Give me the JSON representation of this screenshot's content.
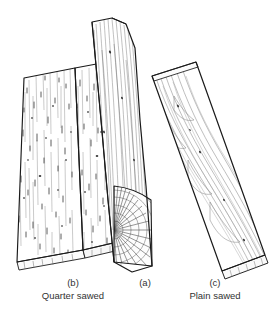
{
  "figure": {
    "background_color": "#ffffff",
    "ink_color": "#1a1a1a",
    "grain_color": "#8a8a8a",
    "width": 273,
    "height": 324
  },
  "captions": {
    "b": {
      "letter": "(b)",
      "name": "Quarter sawed"
    },
    "a": {
      "letter": "(a)",
      "name": ""
    },
    "c": {
      "letter": "(c)",
      "name": "Plain sawed"
    }
  },
  "parts": [
    {
      "id": "b",
      "label": "Quarter sawed",
      "letter": "(b)",
      "description": "Two flat boards lying side by side, leaning left, showing fine straight vertical ray fleck grain"
    },
    {
      "id": "a",
      "label": "",
      "letter": "(a)",
      "description": "Log quarter wedge standing upright, quarter-circle end showing radial rays and concentric growth rings"
    },
    {
      "id": "c",
      "label": "Plain sawed",
      "letter": "(c)",
      "description": "Single board tilted to the right, showing flowing cathedral arch grain"
    }
  ]
}
